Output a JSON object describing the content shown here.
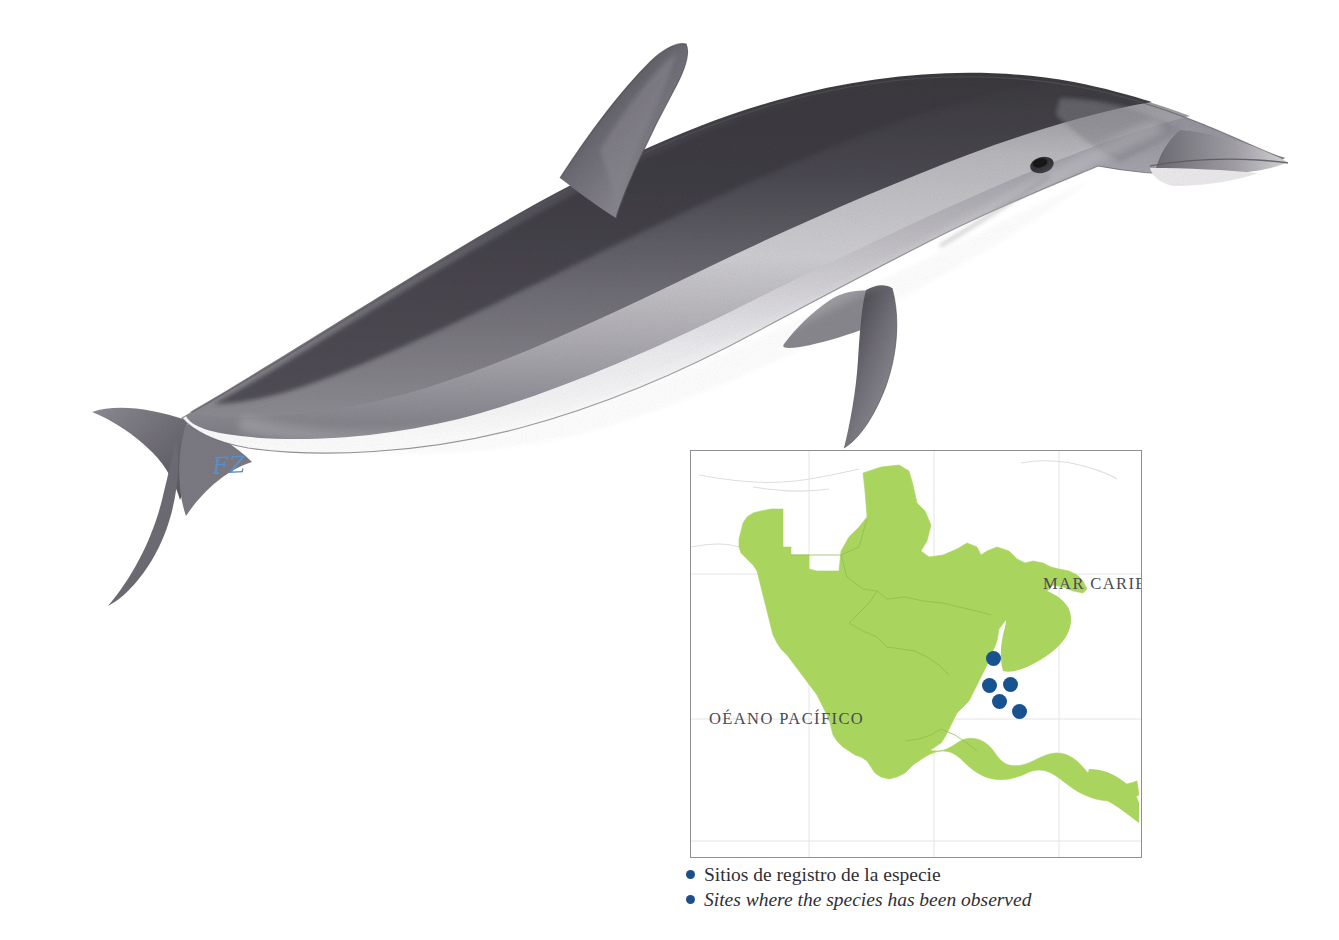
{
  "plate": {
    "background_color": "#ffffff",
    "illustration": {
      "subject": "dolphin",
      "technique": "pencil-illustration",
      "body_colors": {
        "cape": "#4e4c52",
        "flank": "#9a9aa0",
        "belly": "#ffffff",
        "outline": "#55535a"
      },
      "signature": "FZ",
      "signature_color": "#5b8fc9"
    }
  },
  "map": {
    "title": "distribution-map",
    "frame_color": "#8f8f93",
    "land_color": "#a9d55e",
    "sea_color": "#ffffff",
    "graticule_color": "#e2e2e4",
    "labels": {
      "caribbean": "MAR CARIBE",
      "pacific": "OÉANO PACÍFICO"
    },
    "dot_color": "#18528f",
    "sites": [
      {
        "x": 302,
        "y": 207
      },
      {
        "x": 298,
        "y": 234
      },
      {
        "x": 319,
        "y": 233
      },
      {
        "x": 308,
        "y": 250
      },
      {
        "x": 328,
        "y": 260
      }
    ],
    "site_count": 5
  },
  "legend": {
    "items": [
      {
        "label": "Sitios de registro de la especie",
        "lang": "es"
      },
      {
        "label": "Sites where the species has been observed",
        "lang": "en"
      }
    ],
    "bullet_color": "#1b4f8a"
  }
}
